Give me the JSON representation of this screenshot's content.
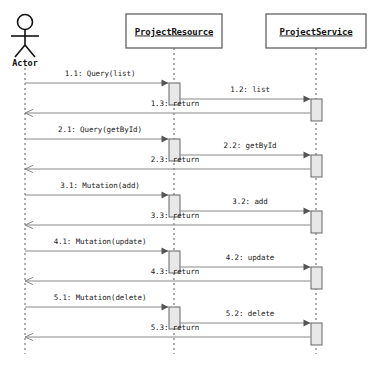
{
  "diagram": {
    "type": "uml-sequence-diagram",
    "width": 377,
    "height": 371,
    "background_color": "#ffffff",
    "line_color": "#888888",
    "activation_fill": "#e8e8e8",
    "activation_stroke": "#666666",
    "box_stroke": "#555555",
    "text_color": "#111111"
  },
  "participants": [
    {
      "id": "actor",
      "label": "Actor",
      "kind": "actor",
      "center_x": 25,
      "lifeline_top": 68,
      "lifeline_bottom": 354
    },
    {
      "id": "resource",
      "label": "ProjectResource",
      "kind": "object",
      "center_x": 174,
      "box": {
        "x": 126,
        "y": 14,
        "width": 96,
        "height": 34
      },
      "lifeline_top": 48,
      "lifeline_bottom": 354
    },
    {
      "id": "service",
      "label": "ProjectService",
      "kind": "object",
      "center_x": 316,
      "box": {
        "x": 266,
        "y": 14,
        "width": 100,
        "height": 34
      },
      "lifeline_top": 48,
      "lifeline_bottom": 354
    }
  ],
  "messages": [
    {
      "seq": "1.1",
      "label": "1.1: Query(list)",
      "from": "actor",
      "to": "resource",
      "y": 83,
      "kind": "call",
      "label_x": 100,
      "label_y": 76
    },
    {
      "seq": "1.2",
      "label": "1.2: list",
      "from": "resource",
      "to": "service",
      "y": 99,
      "kind": "call",
      "label_x": 250,
      "label_y": 92
    },
    {
      "seq": "1.3",
      "label": "1.3: return",
      "from": "service",
      "to": "actor",
      "y": 113,
      "kind": "return",
      "label_x": 175,
      "label_y": 106
    },
    {
      "seq": "2.1",
      "label": "2.1: Query(getById)",
      "from": "actor",
      "to": "resource",
      "y": 139,
      "kind": "call",
      "label_x": 100,
      "label_y": 132
    },
    {
      "seq": "2.2",
      "label": "2.2: getById",
      "from": "resource",
      "to": "service",
      "y": 155,
      "kind": "call",
      "label_x": 250,
      "label_y": 148
    },
    {
      "seq": "2.3",
      "label": "2.3: return",
      "from": "service",
      "to": "actor",
      "y": 169,
      "kind": "return",
      "label_x": 175,
      "label_y": 162
    },
    {
      "seq": "3.1",
      "label": "3.1: Mutation(add)",
      "from": "actor",
      "to": "resource",
      "y": 195,
      "kind": "call",
      "label_x": 100,
      "label_y": 188
    },
    {
      "seq": "3.2",
      "label": "3.2: add",
      "from": "resource",
      "to": "service",
      "y": 211,
      "kind": "call",
      "label_x": 250,
      "label_y": 204
    },
    {
      "seq": "3.3",
      "label": "3.3: return",
      "from": "service",
      "to": "actor",
      "y": 225,
      "kind": "return",
      "label_x": 175,
      "label_y": 218
    },
    {
      "seq": "4.1",
      "label": "4.1: Mutation(update)",
      "from": "actor",
      "to": "resource",
      "y": 251,
      "kind": "call",
      "label_x": 100,
      "label_y": 244
    },
    {
      "seq": "4.2",
      "label": "4.2: update",
      "from": "resource",
      "to": "service",
      "y": 267,
      "kind": "call",
      "label_x": 250,
      "label_y": 260
    },
    {
      "seq": "4.3",
      "label": "4.3: return",
      "from": "service",
      "to": "actor",
      "y": 281,
      "kind": "return",
      "label_x": 175,
      "label_y": 274
    },
    {
      "seq": "5.1",
      "label": "5.1: Mutation(delete)",
      "from": "actor",
      "to": "resource",
      "y": 307,
      "kind": "call",
      "label_x": 100,
      "label_y": 300
    },
    {
      "seq": "5.2",
      "label": "5.2: delete",
      "from": "resource",
      "to": "service",
      "y": 323,
      "kind": "call",
      "label_x": 250,
      "label_y": 316
    },
    {
      "seq": "5.3",
      "label": "5.3: return",
      "from": "service",
      "to": "actor",
      "y": 337,
      "kind": "return",
      "label_x": 175,
      "label_y": 330
    }
  ],
  "activations": [
    {
      "participant": "resource",
      "x": 169,
      "y": 83,
      "width": 11,
      "height": 22
    },
    {
      "participant": "service",
      "x": 311,
      "y": 99,
      "width": 11,
      "height": 22
    },
    {
      "participant": "resource",
      "x": 169,
      "y": 139,
      "width": 11,
      "height": 22
    },
    {
      "participant": "service",
      "x": 311,
      "y": 155,
      "width": 11,
      "height": 22
    },
    {
      "participant": "resource",
      "x": 169,
      "y": 195,
      "width": 11,
      "height": 22
    },
    {
      "participant": "service",
      "x": 311,
      "y": 211,
      "width": 11,
      "height": 22
    },
    {
      "participant": "resource",
      "x": 169,
      "y": 251,
      "width": 11,
      "height": 22
    },
    {
      "participant": "service",
      "x": 311,
      "y": 267,
      "width": 11,
      "height": 22
    },
    {
      "participant": "resource",
      "x": 169,
      "y": 307,
      "width": 11,
      "height": 22
    },
    {
      "participant": "service",
      "x": 311,
      "y": 323,
      "width": 11,
      "height": 22
    }
  ]
}
